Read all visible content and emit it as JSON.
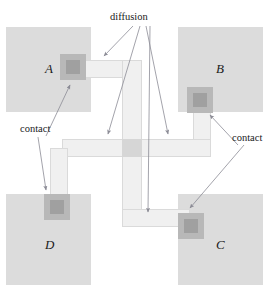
{
  "figure": {
    "width": 273,
    "height": 288,
    "background": "#ffffff"
  },
  "colors": {
    "well": "#dcdcdc",
    "diffusion": "#f0f0f0",
    "diffusion_border": "#dadada",
    "diffusion_node": "#d6d6d6",
    "contact_outer": "#b8b8b8",
    "contact_inner": "#a0a0a0",
    "leader_line": "#8c8c96",
    "text": "#1a1a1a"
  },
  "labels": {
    "diffusion": "diffusion",
    "contact_left": "contact",
    "contact_right": "contact",
    "block_a": "A",
    "block_b": "B",
    "block_c": "C",
    "block_d": "D"
  },
  "blocks": [
    {
      "id": "a",
      "label": "A",
      "x": 6,
      "y": 27,
      "w": 85,
      "h": 85
    },
    {
      "id": "b",
      "label": "B",
      "x": 178,
      "y": 27,
      "w": 85,
      "h": 85
    },
    {
      "id": "d",
      "label": "D",
      "x": 6,
      "y": 194,
      "w": 85,
      "h": 91
    },
    {
      "id": "c",
      "label": "C",
      "x": 178,
      "y": 194,
      "w": 85,
      "h": 91
    }
  ],
  "contacts": [
    {
      "block": "a",
      "outer_x": 60,
      "outer_y": 54,
      "outer_w": 26,
      "outer_h": 26,
      "inner_x": 66,
      "inner_y": 60,
      "inner_w": 14,
      "inner_h": 14
    },
    {
      "block": "b",
      "outer_x": 187,
      "outer_y": 87,
      "outer_w": 26,
      "outer_h": 26,
      "inner_x": 193,
      "inner_y": 93,
      "inner_w": 14,
      "inner_h": 14
    },
    {
      "block": "d",
      "outer_x": 44,
      "outer_y": 194,
      "outer_w": 26,
      "outer_h": 26,
      "inner_x": 50,
      "inner_y": 200,
      "inner_w": 14,
      "inner_h": 14
    },
    {
      "block": "c",
      "outer_x": 178,
      "outer_y": 213,
      "outer_w": 26,
      "outer_h": 26,
      "inner_x": 184,
      "inner_y": 219,
      "inner_w": 14,
      "inner_h": 14
    }
  ],
  "diffusion_bars": [
    {
      "id": "a-to-center-h",
      "x": 70,
      "y": 60,
      "w": 72,
      "h": 18
    },
    {
      "id": "b-to-center-v",
      "x": 193,
      "y": 98,
      "w": 18,
      "h": 50
    },
    {
      "id": "center-h",
      "x": 62,
      "y": 139,
      "w": 149,
      "h": 18
    },
    {
      "id": "center-v",
      "x": 122,
      "y": 60,
      "w": 20,
      "h": 167
    },
    {
      "id": "d-to-center-v",
      "x": 50,
      "y": 148,
      "w": 18,
      "h": 58
    },
    {
      "id": "c-bottom-h",
      "x": 122,
      "y": 209,
      "w": 68,
      "h": 18
    }
  ],
  "diffusion_nodes": [
    {
      "id": "center-cross",
      "x": 122,
      "y": 139,
      "w": 20,
      "h": 18
    }
  ],
  "annotations": [
    {
      "id": "diffusion",
      "text": "diffusion",
      "x": 110,
      "y": 12
    },
    {
      "id": "contact-left",
      "text": "contact",
      "x": 20,
      "y": 124
    },
    {
      "id": "contact-right",
      "text": "contact",
      "x": 232,
      "y": 133
    }
  ],
  "leaders": [
    {
      "id": "diffusion-to-a-bar",
      "from": [
        133,
        26
      ],
      "to": [
        104,
        56
      ]
    },
    {
      "id": "diffusion-to-center-left",
      "from": [
        140,
        26
      ],
      "to": [
        108,
        134
      ]
    },
    {
      "id": "diffusion-to-center-right",
      "from": [
        146,
        26
      ],
      "to": [
        168,
        134
      ]
    },
    {
      "id": "diffusion-to-bottom-bar",
      "from": [
        150,
        26
      ],
      "to": [
        148,
        212
      ]
    },
    {
      "id": "contact-left-to-a",
      "from": [
        46,
        136
      ],
      "to": [
        70,
        85
      ]
    },
    {
      "id": "contact-left-to-d",
      "from": [
        38,
        137
      ],
      "to": [
        46,
        190
      ]
    },
    {
      "id": "contact-right-to-b",
      "from": [
        238,
        145
      ],
      "to": [
        210,
        115
      ]
    },
    {
      "id": "contact-right-to-c",
      "from": [
        244,
        145
      ],
      "to": [
        190,
        208
      ]
    }
  ]
}
